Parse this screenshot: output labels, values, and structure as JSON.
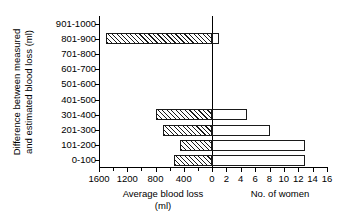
{
  "chart_data": {
    "type": "bar",
    "orientation": "horizontal",
    "title": "",
    "ylabel": "Difference between measured and estimated blood loss (ml)",
    "ylabel_lines": [
      "Difference between measured",
      "and estimated blood loss (ml)"
    ],
    "categories": [
      "0-100",
      "101-200",
      "201-300",
      "301-400",
      "401-500",
      "501-600",
      "601-700",
      "701-800",
      "801-900",
      "901-1000"
    ],
    "left_axis": {
      "label": "Average blood loss",
      "label_unit": "(ml)",
      "ticks": [
        1600,
        1200,
        800,
        400,
        0
      ],
      "tick_labels": [
        "1600",
        "1200",
        "800",
        "400",
        "0"
      ],
      "range": [
        1600,
        0
      ],
      "direction": "left"
    },
    "right_axis": {
      "label": "No. of women",
      "ticks": [
        0,
        2,
        4,
        6,
        8,
        10,
        12,
        14,
        16
      ],
      "tick_labels": [
        "0",
        "2",
        "4",
        "6",
        "8",
        "10",
        "12",
        "14",
        "16"
      ],
      "range": [
        0,
        16
      ],
      "direction": "right"
    },
    "series": [
      {
        "name": "Average blood loss",
        "unit": "ml",
        "axis": "left",
        "fill": "hatched",
        "values": [
          540,
          450,
          690,
          800,
          0,
          0,
          0,
          0,
          1500,
          0
        ]
      },
      {
        "name": "No. of women",
        "unit": "women",
        "axis": "right",
        "fill": "white",
        "values": [
          13,
          13,
          8,
          4.8,
          0,
          0,
          0,
          0,
          1,
          0
        ]
      }
    ],
    "grid": false,
    "legend": "none"
  },
  "colors": {
    "axis": "#000000",
    "bar_outline": "#1a1a1a",
    "bar_fill": "#ffffff",
    "background": "#ffffff"
  }
}
